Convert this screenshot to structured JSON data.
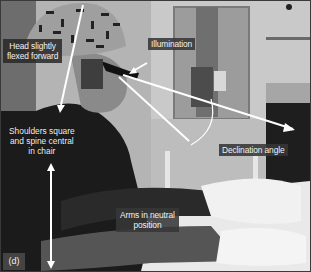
{
  "figure": {
    "panel_label": "(d)",
    "annotations": {
      "head": "Head slightly flexed forward",
      "head_line1": "Head slightly",
      "head_line2": "flexed forward",
      "illumination": "Illumination",
      "shoulders_line1": "Shoulders square",
      "shoulders_line2": "and spine central",
      "shoulders_line3": "in chair",
      "declination": "Declination angle",
      "arms_line1": "Arms in neutral",
      "arms_line2": "position"
    },
    "colors": {
      "label_bg": "#373737",
      "label_text": "#f2f2f2",
      "arrow": "#ffffff",
      "frame_border": "#3a3a3a"
    }
  }
}
